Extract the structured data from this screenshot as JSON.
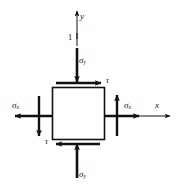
{
  "figure": {
    "background_color": "#ffffff",
    "stroke_color": "#111111",
    "axes": {
      "y_label": "y",
      "x_label": "x",
      "origin_marker_label": "1"
    },
    "element": {
      "shape": "square",
      "outline_color": "#111111"
    },
    "labels": {
      "sigma_y_top": "σ",
      "sigma_y_top_sub": "y",
      "sigma_y_bottom": "σ",
      "sigma_y_bottom_sub": "y",
      "sigma_x_left": "σ",
      "sigma_x_left_sub": "x",
      "sigma_x_right": "σ",
      "sigma_x_right_sub": "x",
      "tau_top": "τ",
      "tau_bottom": "τ"
    }
  }
}
